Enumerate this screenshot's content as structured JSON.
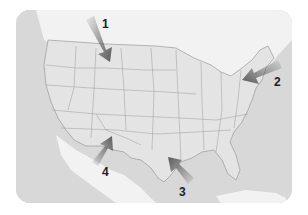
{
  "map": {
    "region": "United States (contiguous)",
    "style": "grayscale",
    "colors": {
      "ocean": "#d8d8d8",
      "land_us": "#e4e4e4",
      "land_other": "#f2f2f2",
      "border": "#9a9a9a",
      "arrow": "#5a5a5a",
      "label": "#222222"
    }
  },
  "arrows": [
    {
      "id": 1,
      "label": "1",
      "region": "Montana / Idaho (northwest)",
      "direction": "pointing southeast"
    },
    {
      "id": 2,
      "label": "2",
      "region": "Mid-Atlantic coast (east)",
      "direction": "pointing west-southwest"
    },
    {
      "id": 3,
      "label": "3",
      "region": "Gulf Coast (Texas/Louisiana)",
      "direction": "pointing northwest"
    },
    {
      "id": 4,
      "label": "4",
      "region": "Southwest (Arizona/New Mexico)",
      "direction": "pointing northeast"
    }
  ]
}
